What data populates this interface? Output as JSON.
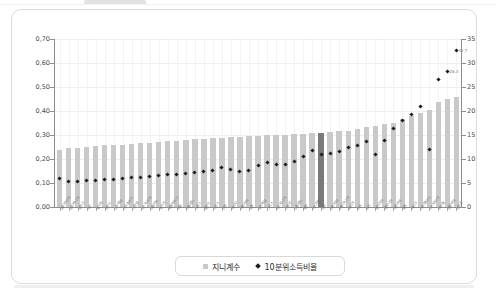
{
  "chart_data": {
    "type": "bar",
    "title": "",
    "subtitle": "",
    "xlabel": "",
    "ylabel_left": "",
    "ylabel_right": "",
    "ylim_left": [
      0.0,
      0.7
    ],
    "ylim_right": [
      0,
      35
    ],
    "yticks_left": [
      "0,00",
      "0,10",
      "0,20",
      "0,30",
      "0,40",
      "0,50",
      "0,60",
      "0,70"
    ],
    "yticks_left_values": [
      0.0,
      0.1,
      0.2,
      0.3,
      0.4,
      0.5,
      0.6,
      0.7
    ],
    "yticks_right": [
      "0",
      "5",
      "10",
      "15",
      "20",
      "25",
      "30",
      "35"
    ],
    "yticks_right_values": [
      0,
      5,
      10,
      15,
      20,
      25,
      30,
      35
    ],
    "grid": true,
    "legend_position": "bottom-center",
    "highlight_index": 29,
    "categories": [
      "슬로바키아",
      "슬로베니아",
      "덴마크",
      "체코",
      "벨기에",
      "핀란드",
      "노르웨이",
      "아이슬란드",
      "스웨덴",
      "오스트리아",
      "네덜란드",
      "헝가리",
      "룩셈부르크",
      "독일",
      "아일랜드",
      "스위스",
      "폴란드",
      "프랑스",
      "한국",
      "캐나다",
      "이탈리아",
      "호주",
      "포르투갈",
      "그리스",
      "에스토니아",
      "스페인",
      "뉴질랜드",
      "일본",
      "이스라엘",
      "영국",
      "라트비아",
      "리투아니아",
      "러시아",
      "미국",
      "터키",
      "불가리아",
      "루마니아",
      "우루과이",
      "칠레",
      "멕시코",
      "아르헨티나",
      "코스타리카",
      "브라질",
      "콜롬비아",
      "남아공"
    ],
    "series": [
      {
        "name": "지니계수",
        "axis": "left",
        "marker": "bar",
        "color": "#c9c9c9",
        "highlight_color": "#7a7a7a",
        "values": [
          0.237,
          0.244,
          0.247,
          0.249,
          0.253,
          0.257,
          0.259,
          0.26,
          0.263,
          0.265,
          0.268,
          0.272,
          0.275,
          0.277,
          0.28,
          0.283,
          0.284,
          0.286,
          0.288,
          0.29,
          0.292,
          0.294,
          0.296,
          0.298,
          0.3,
          0.302,
          0.304,
          0.306,
          0.308,
          0.31,
          0.312,
          0.315,
          0.318,
          0.326,
          0.332,
          0.336,
          0.344,
          0.352,
          0.368,
          0.38,
          0.392,
          0.404,
          0.436,
          0.452,
          0.46
        ]
      },
      {
        "name": "10분위소득비율",
        "axis": "right",
        "marker": "diamond",
        "color": "#1c1c1c",
        "values": [
          5.9,
          5.3,
          5.3,
          5.5,
          5.6,
          5.7,
          5.8,
          5.9,
          6.1,
          6.2,
          6.4,
          6.5,
          6.7,
          6.8,
          6.9,
          7.1,
          7.4,
          7.7,
          8.2,
          7.9,
          7.5,
          7.6,
          8.6,
          9.2,
          8.8,
          8.9,
          9.4,
          10.6,
          11.7,
          10.9,
          11.2,
          11.6,
          12.4,
          12.8,
          13.6,
          11.0,
          13.9,
          16.4,
          18.0,
          19.2,
          21.0,
          12.0,
          26.5,
          28.3,
          32.7
        ]
      }
    ],
    "data_labels": [
      {
        "index": 43,
        "text": "28,3"
      },
      {
        "index": 44,
        "text": "32,7"
      }
    ]
  },
  "legend": {
    "items": [
      {
        "label": "지니계수",
        "marker": "square",
        "color": "#c9c9c9"
      },
      {
        "label": "10분위소득비율",
        "marker": "diamond",
        "color": "#1c1c1c"
      }
    ]
  }
}
